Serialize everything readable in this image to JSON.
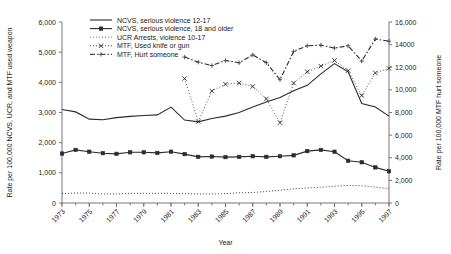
{
  "chart_data": {
    "type": "line",
    "title": "",
    "xlabel": "Year",
    "ylabel_left": "Rate per 100,000 NCVS, UCR, and MTF used weapon",
    "ylabel_right": "Rate per 100,000 MTF hurt someone",
    "grid": false,
    "legend_position": "top-center",
    "x": [
      1973,
      1974,
      1975,
      1976,
      1977,
      1978,
      1979,
      1980,
      1981,
      1982,
      1983,
      1984,
      1985,
      1986,
      1987,
      1988,
      1989,
      1990,
      1991,
      1992,
      1993,
      1994,
      1995,
      1996,
      1997
    ],
    "xlim": [
      1973,
      1997
    ],
    "xtick_labels": [
      "1973",
      "1975",
      "1977",
      "1979",
      "1981",
      "1983",
      "1985",
      "1987",
      "1989",
      "1991",
      "1993",
      "1995",
      "1997"
    ],
    "xtick_values": [
      1973,
      1975,
      1977,
      1979,
      1981,
      1983,
      1985,
      1987,
      1989,
      1991,
      1993,
      1995,
      1997
    ],
    "ylim_left": [
      0,
      6000
    ],
    "ytick_labels_left": [
      "0",
      "1,000",
      "2,000",
      "3,000",
      "4,000",
      "5,000",
      "6,000"
    ],
    "ytick_values_left": [
      0,
      1000,
      2000,
      3000,
      4000,
      5000,
      6000
    ],
    "ylim_right": [
      0,
      16000
    ],
    "ytick_labels_right": [
      "0",
      "2,000",
      "4,000",
      "6,000",
      "8,000",
      "10,000",
      "12,000",
      "14000",
      "16,000"
    ],
    "ytick_values_right": [
      0,
      2000,
      4000,
      6000,
      8000,
      10000,
      12000,
      14000,
      16000
    ],
    "series": [
      {
        "name": "NCVS, serious violence 12-17",
        "axis": "left",
        "style": "solid",
        "marker": "none",
        "color": "#2b2b2b",
        "x": [
          1973,
          1974,
          1975,
          1976,
          1977,
          1978,
          1979,
          1980,
          1981,
          1982,
          1983,
          1984,
          1985,
          1986,
          1987,
          1988,
          1989,
          1990,
          1991,
          1992,
          1993,
          1994,
          1995,
          1996,
          1997
        ],
        "values": [
          3100,
          3020,
          2780,
          2760,
          2830,
          2870,
          2900,
          2920,
          3180,
          2750,
          2690,
          2800,
          2880,
          3000,
          3180,
          3350,
          3500,
          3720,
          3900,
          4280,
          4620,
          4350,
          3300,
          3180,
          2880
        ]
      },
      {
        "name": "NCVS, serious violence, 18 and older",
        "axis": "left",
        "style": "solid",
        "marker": "square",
        "color": "#2b2b2b",
        "x": [
          1973,
          1974,
          1975,
          1976,
          1977,
          1978,
          1979,
          1980,
          1981,
          1982,
          1983,
          1984,
          1985,
          1986,
          1987,
          1988,
          1989,
          1990,
          1991,
          1992,
          1993,
          1994,
          1995,
          1996,
          1997
        ],
        "values": [
          1640,
          1760,
          1700,
          1650,
          1630,
          1680,
          1680,
          1660,
          1700,
          1620,
          1530,
          1540,
          1520,
          1530,
          1550,
          1530,
          1550,
          1580,
          1720,
          1760,
          1700,
          1400,
          1350,
          1180,
          1050
        ]
      },
      {
        "name": "UCR Arrests, violence 10-17",
        "axis": "left",
        "style": "dotted",
        "marker": "none",
        "color": "#6a6a6a",
        "x": [
          1973,
          1974,
          1975,
          1976,
          1977,
          1978,
          1979,
          1980,
          1981,
          1982,
          1983,
          1984,
          1985,
          1986,
          1987,
          1988,
          1989,
          1990,
          1991,
          1992,
          1993,
          1994,
          1995,
          1996,
          1997
        ],
        "values": [
          310,
          330,
          330,
          300,
          300,
          320,
          320,
          320,
          320,
          310,
          300,
          300,
          310,
          340,
          350,
          380,
          420,
          470,
          500,
          520,
          560,
          580,
          570,
          530,
          470
        ]
      },
      {
        "name": "MTF, Used knife or gun",
        "axis": "right",
        "style": "dotted",
        "marker": "x",
        "color": "#2b2b2b",
        "x": [
          1982,
          1983,
          1984,
          1985,
          1986,
          1987,
          1988,
          1989,
          1990,
          1991,
          1992,
          1993,
          1994,
          1995,
          1996,
          1997
        ],
        "values": [
          11000,
          7200,
          9900,
          10500,
          10600,
          10300,
          9200,
          7100,
          10600,
          11600,
          12100,
          12600,
          11700,
          9500,
          11500,
          11900
        ]
      },
      {
        "name": "MTF, Hurt someone",
        "axis": "right",
        "style": "dashdot",
        "marker": "plus",
        "color": "#4a4a4a",
        "x": [
          1982,
          1983,
          1984,
          1985,
          1986,
          1987,
          1988,
          1989,
          1990,
          1991,
          1992,
          1993,
          1994,
          1995,
          1996,
          1997
        ],
        "values": [
          12900,
          12450,
          12150,
          12600,
          12400,
          13100,
          12400,
          10900,
          13400,
          13900,
          13950,
          13700,
          13900,
          12550,
          14500,
          14300
        ]
      }
    ]
  },
  "legend": {
    "items": [
      {
        "label": "NCVS, serious violence 12-17"
      },
      {
        "label": "NCVS, serious violence, 18 and older"
      },
      {
        "label": "UCR Arrests, violence 10-17"
      },
      {
        "label": "MTF, Used knife or gun"
      },
      {
        "label": "MTF, Hurt someone"
      }
    ]
  }
}
